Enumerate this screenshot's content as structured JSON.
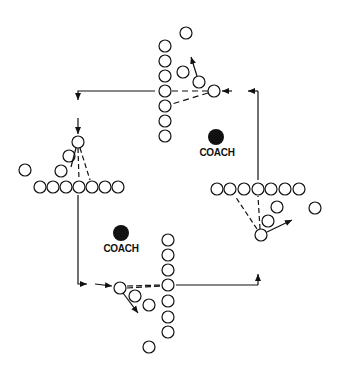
{
  "diagram": {
    "title": "",
    "colors": {
      "ink": "#111111",
      "background": "#ffffff"
    },
    "coaches": [
      {
        "label": "COACH",
        "x": 216,
        "y": 137
      },
      {
        "label": "COACH",
        "x": 121,
        "y": 233
      }
    ],
    "stations": [
      {
        "name": "top",
        "line_orientation": "vertical",
        "line_players": 7
      },
      {
        "name": "left",
        "line_orientation": "horizontal",
        "line_players": 7
      },
      {
        "name": "bottom",
        "line_orientation": "vertical",
        "line_players": 7
      },
      {
        "name": "right",
        "line_orientation": "horizontal",
        "line_players": 7
      }
    ],
    "flow": "clockwise rotation between four stations"
  }
}
